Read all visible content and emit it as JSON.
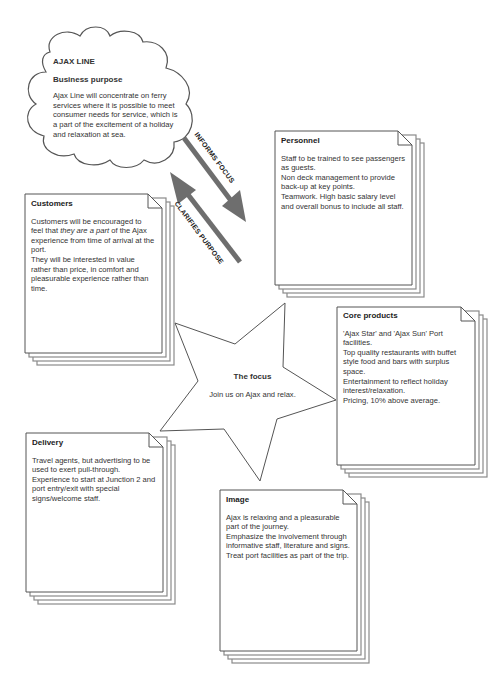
{
  "cloud": {
    "title": "AJAX LINE",
    "subtitle": "Business purpose",
    "body": "Ajax Line will concentrate on ferry services where it is possible to meet consumer needs for service, which is a part of the excitement of a holiday and relaxation at sea."
  },
  "arrows": {
    "informs": "INFORMS FOCUS",
    "clarifies": "CLARIFIES PURPOSE"
  },
  "focus": {
    "title": "The focus",
    "body": "Join us on Ajax and relax."
  },
  "cards": {
    "personnel": {
      "title": "Personnel",
      "lines": [
        "Staff to be trained to see passengers as guests.",
        "Non deck management to provide back-up at key points.",
        "Teamwork. High basic salary level and overall bonus to include all staff."
      ]
    },
    "customers": {
      "title": "Customers",
      "line1_pre": "Customers will be encouraged to feel that ",
      "line1_em": "they are a part",
      "line1_post": " of the Ajax experience from time of arrival at the port.",
      "line2": "They will be interested in value rather than price, in comfort and pleasurable experience rather than time."
    },
    "core_products": {
      "title": "Core products",
      "lines": [
        "'Ajax Star' and 'Ajax Sun' Port facilities.",
        "Top quality restaurants with buffet style food and bars with surplus space.",
        "Entertainment to reflect holiday interest/relaxation.",
        "Pricing, 10% above average."
      ]
    },
    "delivery": {
      "title": "Delivery",
      "lines": [
        "Travel agents, but advertising to be used to exert pull-through.",
        "Experience to start at Junction 2 and port entry/exit with special signs/welcome staff."
      ]
    },
    "image": {
      "title": "Image",
      "lines": [
        "Ajax is relaxing and a pleasurable part of the journey.",
        "Emphasize the involvement through informative staff, literature and signs.",
        "Treat port facilities as part of the trip."
      ]
    }
  },
  "colors": {
    "outline": "#555555",
    "arrow": "#6e6e6e",
    "stack": "#8a8a8a"
  }
}
